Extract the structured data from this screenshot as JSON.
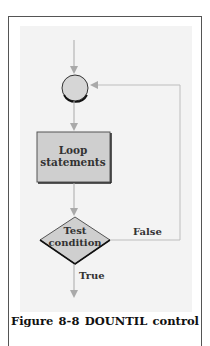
{
  "figure": {
    "nodes": {
      "connector": {
        "shape": "circle",
        "label": ""
      },
      "process": {
        "shape": "rectangle",
        "label_line1": "Loop",
        "label_line2": "statements"
      },
      "decision": {
        "shape": "diamond",
        "label_line1": "Test",
        "label_line2": "condition"
      }
    },
    "edges": {
      "false_label": "False",
      "true_label": "True"
    },
    "caption": {
      "word1": "Figure",
      "word2": "8-8",
      "word3": "DOUNTIL",
      "word4": "control"
    },
    "colors": {
      "panel": "#f3f3f3",
      "shape_fill": "#cfcfcf",
      "arrow": "#a9a9a9",
      "outline": "#222222"
    }
  }
}
